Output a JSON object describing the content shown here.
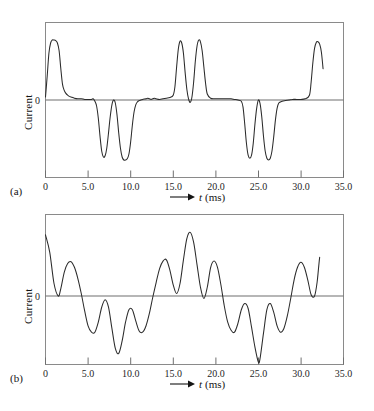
{
  "figure": {
    "background_color": "#ffffff",
    "line_color": "#2b2b2b",
    "axis_color": "#6f6f6f",
    "frame_color": "#8a8a8a"
  },
  "panels": [
    {
      "caption": "(a)",
      "y_axis_title": "Current",
      "y_zero_label": "0",
      "x_axis_title_var": "t",
      "x_axis_title_unit": "(ms)",
      "x_tick_labels": [
        "0",
        "5.0",
        "10.0",
        "15.0",
        "20.0",
        "25.0",
        "30.0",
        "35.0"
      ]
    },
    {
      "caption": "(b)",
      "y_axis_title": "Current",
      "y_zero_label": "0",
      "x_axis_title_var": "t",
      "x_axis_title_unit": "(ms)",
      "x_tick_labels": [
        "0",
        "5.0",
        "10.0",
        "15.0",
        "20.0",
        "25.0",
        "30.0",
        "35.0"
      ]
    }
  ],
  "chart_data": [
    {
      "type": "line",
      "title": "",
      "panel": "(a)",
      "xlabel": "t (ms)",
      "ylabel": "Current",
      "xlim": [
        0,
        35
      ],
      "ylim": [
        -1.25,
        1.25
      ],
      "xticks": [
        0,
        5,
        10,
        15,
        20,
        25,
        30,
        35
      ],
      "xticklabels": [
        "0",
        "5.0",
        "10.0",
        "15.0",
        "20.0",
        "25.0",
        "30.0",
        "35.0"
      ],
      "yticks": [
        0
      ],
      "yticklabels": [
        "0"
      ],
      "grid": false,
      "legend": null,
      "series": [
        {
          "name": "current",
          "comment": "Isolated raised-cosine pulses; baseline 0 between pulses.",
          "x": [
            0.0,
            0.2,
            0.4,
            0.6,
            0.8,
            1.0,
            1.2,
            1.4,
            1.6,
            1.8,
            2.0,
            2.2,
            2.4,
            2.6,
            2.8,
            3.0,
            3.4,
            3.8,
            4.2,
            4.6,
            5.0,
            5.4,
            5.6,
            5.8,
            6.0,
            6.2,
            6.4,
            6.6,
            6.8,
            7.0,
            7.2,
            7.4,
            7.6,
            7.8,
            8.0,
            8.2,
            8.4,
            8.6,
            8.8,
            9.0,
            9.2,
            9.4,
            9.6,
            9.8,
            10.0,
            10.2,
            10.4,
            10.6,
            10.8,
            11.0,
            11.2,
            11.4,
            11.8,
            12.0,
            12.2,
            12.4,
            12.6,
            12.8,
            13.0,
            13.4,
            13.8,
            14.2,
            14.6,
            15.0,
            15.2,
            15.4,
            15.6,
            15.8,
            16.0,
            16.2,
            16.4,
            16.6,
            16.8,
            17.0,
            17.2,
            17.4,
            17.6,
            17.8,
            18.0,
            18.2,
            18.4,
            18.6,
            18.8,
            19.0,
            19.4,
            19.8,
            20.2,
            20.6,
            21.0,
            21.4,
            21.8,
            22.2,
            22.6,
            23.0,
            23.2,
            23.4,
            23.6,
            23.8,
            24.0,
            24.2,
            24.4,
            24.6,
            24.8,
            25.0,
            25.2,
            25.4,
            25.6,
            25.8,
            26.0,
            26.2,
            26.4,
            26.6,
            26.8,
            27.0,
            27.2,
            27.4,
            27.8,
            28.2,
            28.6,
            29.0,
            29.5,
            30.0,
            30.5,
            31.0,
            31.2,
            31.4,
            31.6,
            31.8,
            32.0,
            32.2,
            32.4,
            32.6,
            32.8,
            33.0
          ],
          "y": [
            0.05,
            0.4,
            0.78,
            0.95,
            1.0,
            1.0,
            0.99,
            0.95,
            0.82,
            0.52,
            0.26,
            0.16,
            0.11,
            0.08,
            0.06,
            0.05,
            0.03,
            0.02,
            0.02,
            0.01,
            0.01,
            0.01,
            0.02,
            -0.02,
            -0.1,
            -0.3,
            -0.6,
            -0.85,
            -0.95,
            -0.93,
            -0.8,
            -0.55,
            -0.28,
            -0.08,
            0.0,
            -0.05,
            -0.25,
            -0.55,
            -0.8,
            -0.95,
            -1.0,
            -1.0,
            -0.98,
            -0.9,
            -0.7,
            -0.42,
            -0.2,
            -0.08,
            -0.03,
            -0.01,
            0.0,
            0.01,
            0.02,
            0.03,
            0.02,
            0.01,
            0.02,
            0.03,
            0.02,
            0.01,
            0.02,
            0.03,
            0.04,
            0.08,
            0.22,
            0.55,
            0.85,
            0.98,
            0.95,
            0.78,
            0.46,
            0.18,
            0.02,
            -0.04,
            0.05,
            0.3,
            0.65,
            0.9,
            1.0,
            0.97,
            0.82,
            0.55,
            0.28,
            0.1,
            0.03,
            0.02,
            0.02,
            0.02,
            0.02,
            0.02,
            0.02,
            0.01,
            0.0,
            -0.02,
            -0.12,
            -0.4,
            -0.72,
            -0.92,
            -0.97,
            -0.92,
            -0.72,
            -0.4,
            -0.14,
            0.0,
            -0.06,
            -0.28,
            -0.6,
            -0.85,
            -0.97,
            -1.0,
            -0.97,
            -0.85,
            -0.62,
            -0.34,
            -0.14,
            -0.05,
            -0.02,
            -0.01,
            0.0,
            0.01,
            0.01,
            0.01,
            0.02,
            0.08,
            0.3,
            0.62,
            0.86,
            0.96,
            0.97,
            0.93,
            0.8,
            0.52,
            0.16
          ]
        }
      ]
    },
    {
      "type": "line",
      "title": "",
      "panel": "(b)",
      "xlabel": "t (ms)",
      "ylabel": "Current",
      "xlim": [
        0,
        35
      ],
      "ylim": [
        -1.25,
        1.25
      ],
      "xticks": [
        0,
        5,
        10,
        15,
        20,
        25,
        30,
        35
      ],
      "xticklabels": [
        "0",
        "5.0",
        "10.0",
        "15.0",
        "20.0",
        "25.0",
        "30.0",
        "35.0"
      ],
      "yticks": [
        0
      ],
      "yticklabels": [
        "0"
      ],
      "grid": false,
      "legend": null,
      "series": [
        {
          "name": "current",
          "comment": "Overlapping/dispersed pulse train - continuously varying waveform.",
          "x": [
            0.0,
            0.5,
            1.0,
            1.5,
            1.8,
            2.2,
            2.6,
            3.0,
            3.4,
            3.8,
            4.2,
            4.6,
            5.0,
            5.4,
            5.8,
            6.2,
            6.6,
            7.0,
            7.4,
            7.8,
            8.2,
            8.6,
            9.0,
            9.4,
            9.8,
            10.2,
            10.6,
            11.0,
            11.4,
            11.8,
            12.2,
            12.6,
            13.0,
            13.4,
            13.8,
            14.2,
            14.6,
            15.0,
            15.4,
            15.8,
            16.2,
            16.6,
            17.0,
            17.4,
            17.8,
            18.2,
            18.6,
            19.0,
            19.4,
            19.8,
            20.2,
            20.6,
            21.0,
            21.4,
            21.8,
            22.2,
            22.6,
            23.0,
            23.4,
            23.8,
            24.2,
            24.6,
            25.0,
            25.2,
            25.6,
            26.0,
            26.4,
            26.8,
            27.2,
            27.6,
            28.0,
            28.4,
            28.8,
            29.2,
            29.6,
            30.0,
            30.4,
            30.8,
            31.2,
            31.6,
            31.9,
            32.2,
            32.6,
            33.0
          ],
          "y": [
            0.98,
            0.7,
            0.2,
            0.0,
            0.12,
            0.38,
            0.52,
            0.55,
            0.46,
            0.28,
            0.04,
            -0.24,
            -0.48,
            -0.58,
            -0.58,
            -0.42,
            -0.18,
            -0.06,
            -0.18,
            -0.52,
            -0.84,
            -0.92,
            -0.72,
            -0.42,
            -0.22,
            -0.22,
            -0.4,
            -0.56,
            -0.58,
            -0.48,
            -0.28,
            -0.02,
            0.22,
            0.44,
            0.56,
            0.58,
            0.42,
            0.18,
            0.04,
            0.2,
            0.58,
            0.92,
            1.02,
            0.86,
            0.5,
            0.14,
            -0.04,
            0.14,
            0.46,
            0.56,
            0.46,
            0.18,
            -0.16,
            -0.42,
            -0.55,
            -0.58,
            -0.44,
            -0.22,
            -0.12,
            -0.2,
            -0.5,
            -0.82,
            -1.06,
            -1.0,
            -0.6,
            -0.22,
            -0.12,
            -0.26,
            -0.48,
            -0.58,
            -0.52,
            -0.32,
            -0.04,
            0.26,
            0.46,
            0.54,
            0.46,
            0.26,
            0.02,
            0.0,
            0.22,
            0.62,
            0.98
          ]
        }
      ]
    }
  ]
}
